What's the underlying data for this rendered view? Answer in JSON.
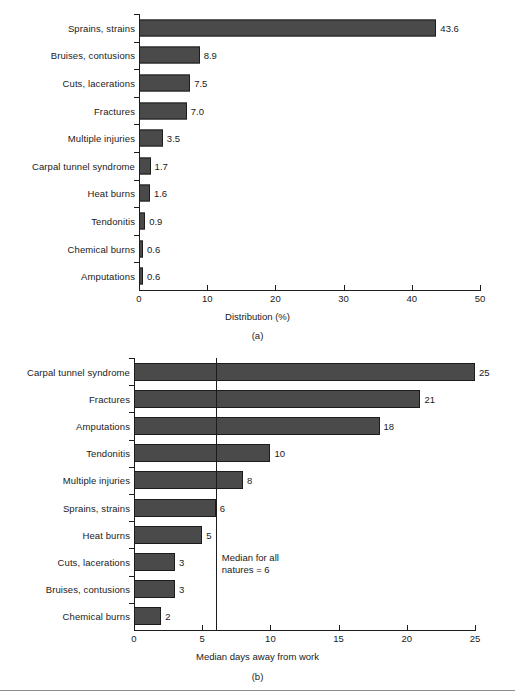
{
  "figure": {
    "background": "#ffffff",
    "bar_color": "#4a4a4a",
    "bar_border_color": "#1c1c1c",
    "axis_color": "#1c1c1c"
  },
  "chart_data": [
    {
      "id": "a",
      "type": "bar",
      "orientation": "horizontal",
      "title": "",
      "xlabel": "Distribution (%)",
      "ylabel": "",
      "caption": "(a)",
      "categories": [
        "Sprains, strains",
        "Bruises, contusions",
        "Cuts, lacerations",
        "Fractures",
        "Multiple injuries",
        "Carpal tunnel syndrome",
        "Heat burns",
        "Tendonitis",
        "Chemical burns",
        "Amputations"
      ],
      "values": [
        43.6,
        8.9,
        7.5,
        7.0,
        3.5,
        1.7,
        1.6,
        0.9,
        0.6,
        0.6
      ],
      "value_labels": [
        "43.6",
        "8.9",
        "7.5",
        "7.0",
        "3.5",
        "1.7",
        "1.6",
        "0.9",
        "0.6",
        "0.6"
      ],
      "xlim": [
        0,
        50
      ],
      "xticks": [
        0,
        10,
        20,
        30,
        40,
        50
      ],
      "xtick_labels": [
        "0",
        "10",
        "20",
        "30",
        "40",
        "50"
      ],
      "grid": false,
      "legend": "none"
    },
    {
      "id": "b",
      "type": "bar",
      "orientation": "horizontal",
      "title": "",
      "xlabel": "Median days away from work",
      "ylabel": "",
      "caption": "(b)",
      "categories": [
        "Carpal tunnel syndrome",
        "Fractures",
        "Amputations",
        "Tendonitis",
        "Multiple injuries",
        "Sprains, strains",
        "Heat burns",
        "Cuts, lacerations",
        "Bruises, contusions",
        "Chemical burns"
      ],
      "values": [
        25,
        21,
        18,
        10,
        8,
        6,
        5,
        3,
        3,
        2
      ],
      "value_labels": [
        "25",
        "21",
        "18",
        "10",
        "8",
        "6",
        "5",
        "3",
        "3",
        "2"
      ],
      "xlim": [
        0,
        25
      ],
      "xticks": [
        0,
        5,
        10,
        15,
        20,
        25
      ],
      "xtick_labels": [
        "0",
        "5",
        "10",
        "15",
        "20",
        "25"
      ],
      "grid": false,
      "legend": "none",
      "annotations": [
        {
          "name": "median-reference-line",
          "value": 6,
          "text_line1": "Median for all",
          "text_line2": "natures = 6"
        }
      ]
    }
  ]
}
